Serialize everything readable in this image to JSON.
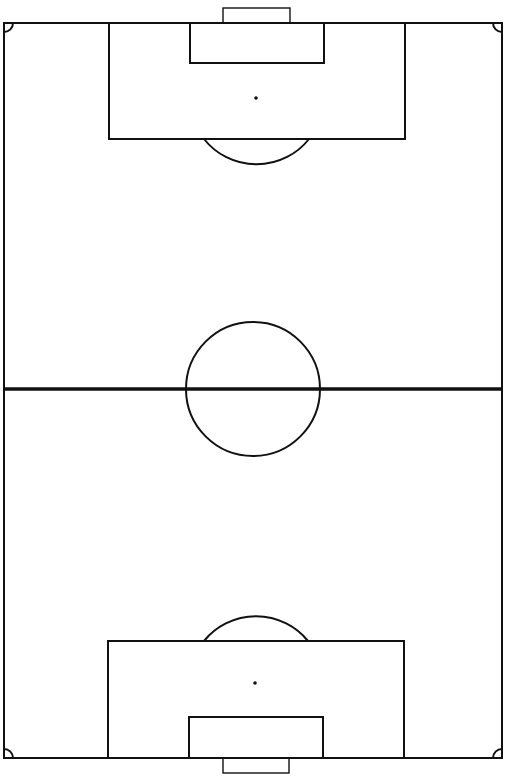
{
  "diagram": {
    "type": "soccer-pitch",
    "orientation": "vertical",
    "colors": {
      "background": "#ffffff",
      "line": "#111111"
    },
    "canvas": {
      "width": 505,
      "height": 778
    },
    "pitch": {
      "x": 4,
      "y": 23,
      "width": 498,
      "height": 735,
      "stroke": 2
    },
    "halfway_line": {
      "y": 389,
      "stroke": 3.5
    },
    "center_circle": {
      "cx": 253,
      "cy": 389,
      "r": 67,
      "stroke": 2
    },
    "top": {
      "goal": {
        "x": 223,
        "y": 8,
        "width": 67,
        "height": 15
      },
      "goal_area": {
        "x": 190,
        "y": 23,
        "width": 134,
        "height": 40
      },
      "penalty_area": {
        "x": 109,
        "y": 23,
        "width": 296,
        "height": 116
      },
      "penalty_spot": {
        "cx": 256,
        "cy": 98,
        "r": 1.8
      },
      "penalty_arc": {
        "x1": 204,
        "x2": 309,
        "y": 139,
        "r": 67,
        "cx": 256,
        "cy": 98
      }
    },
    "bottom": {
      "goal": {
        "x": 223,
        "y": 758,
        "width": 66,
        "height": 15
      },
      "goal_area": {
        "x": 189,
        "y": 717,
        "width": 134,
        "height": 41
      },
      "penalty_area": {
        "x": 108,
        "y": 641,
        "width": 296,
        "height": 117
      },
      "penalty_spot": {
        "cx": 255,
        "cy": 683,
        "r": 1.8
      },
      "penalty_arc": {
        "x1": 204,
        "x2": 308,
        "y": 641,
        "r": 67,
        "cx": 255,
        "cy": 683
      }
    },
    "corner_arcs": {
      "r": 9
    }
  }
}
